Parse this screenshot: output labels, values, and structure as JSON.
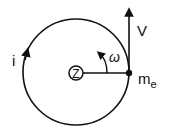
{
  "diagram": {
    "nucleus_label": "Z",
    "current_label": "i",
    "angular_velocity_label": "ω",
    "velocity_label": "V",
    "electron_label": "m",
    "electron_subscript": "e",
    "colors": {
      "stroke": "#111111",
      "background": "#ffffff"
    }
  }
}
